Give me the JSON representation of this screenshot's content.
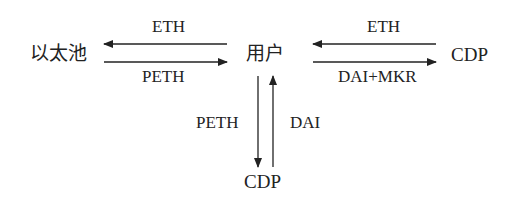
{
  "diagram": {
    "nodes": {
      "ether_pool": "以太池",
      "user": "用户",
      "cdp_right": "CDP",
      "cdp_bottom": "CDP"
    },
    "edges": {
      "user_to_pool": "ETH",
      "pool_to_user": "PETH",
      "cdp_to_user": "ETH",
      "user_to_cdp": "DAI+MKR",
      "user_to_cdp_bottom": "PETH",
      "cdp_bottom_to_user": "DAI"
    },
    "colors": {
      "line": "#222222",
      "text": "#222222",
      "background": "#ffffff"
    }
  }
}
